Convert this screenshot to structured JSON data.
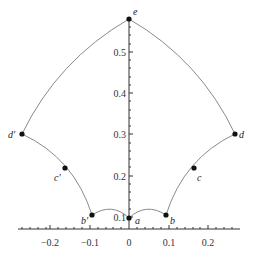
{
  "diagram": {
    "type": "curve-plot",
    "x_axis": {
      "ticks": [
        {
          "value": -0.2,
          "label": "−0.2"
        },
        {
          "value": -0.1,
          "label": "−0.1"
        },
        {
          "value": 0,
          "label": "0"
        },
        {
          "value": 0.1,
          "label": "0.1"
        },
        {
          "value": 0.2,
          "label": "0.2"
        }
      ],
      "range": [
        -0.27,
        0.27
      ]
    },
    "y_axis": {
      "ticks": [
        {
          "value": 0.1,
          "label": "0.1"
        },
        {
          "value": 0.2,
          "label": "0.2"
        },
        {
          "value": 0.3,
          "label": "0.3"
        },
        {
          "value": 0.4,
          "label": "0.4"
        },
        {
          "value": 0.5,
          "label": "0.5"
        }
      ],
      "range": [
        0.07,
        0.58
      ]
    },
    "points": [
      {
        "id": "a",
        "label": "a",
        "x": 0.0,
        "y": 0.1
      },
      {
        "id": "b",
        "label": "b",
        "x": 0.095,
        "y": 0.108
      },
      {
        "id": "c",
        "label": "c",
        "x": 0.162,
        "y": 0.222
      },
      {
        "id": "d",
        "label": "d",
        "x": 0.26,
        "y": 0.3
      },
      {
        "id": "e",
        "label": "e",
        "x": 0.0,
        "y": 0.57
      },
      {
        "id": "b_prime",
        "label": "b′",
        "x": -0.095,
        "y": 0.108
      },
      {
        "id": "c_prime",
        "label": "c′",
        "x": -0.162,
        "y": 0.222
      },
      {
        "id": "d_prime",
        "label": "d′",
        "x": -0.26,
        "y": 0.3
      }
    ],
    "colors": {
      "curve": "#8a8a8a",
      "axis": "#333333",
      "point": "#111111"
    }
  }
}
